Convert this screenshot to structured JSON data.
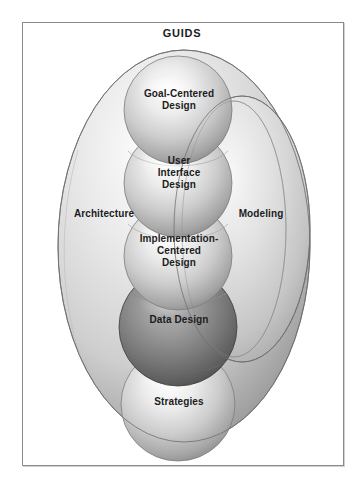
{
  "figure": {
    "title": "GUIDS",
    "background_color": "#ffffff",
    "frame_border_color": "#8b8b8b",
    "outline_color": "#6e6e6e",
    "text_color": "#1c1c1c"
  },
  "regions": [
    {
      "id": "architecture",
      "label": "Architecture",
      "shape": "ellipse",
      "fill_light": "#f2f2f2",
      "fill_dark": "#9a9a9a"
    },
    {
      "id": "modeling",
      "label": "Modeling",
      "shape": "ellipse",
      "fill_light": "#efefef",
      "fill_dark": "#a2a2a2"
    }
  ],
  "spheres": [
    {
      "id": "goal-centered-design",
      "label": "Goal-Centered\nDesign",
      "line1": "Goal-Centered",
      "line2": "Design",
      "line3": "",
      "fill_light": "#fbfbfb",
      "fill_dark": "#8d8d8d",
      "tone": "light"
    },
    {
      "id": "user-interface-design",
      "label": "User Interface Design",
      "line1": "User",
      "line2": "Interface",
      "line3": "Design",
      "fill_light": "#fbfbfb",
      "fill_dark": "#8d8d8d",
      "tone": "light"
    },
    {
      "id": "implementation-centered-design",
      "label": "Implementation-Centered Design",
      "line1": "Implementation-",
      "line2": "Centered",
      "line3": "Design",
      "fill_light": "#fbfbfb",
      "fill_dark": "#8d8d8d",
      "tone": "light"
    },
    {
      "id": "data-design",
      "label": "Data Design",
      "line1": "Data Design",
      "line2": "",
      "line3": "",
      "fill_light": "#a9a9a9",
      "fill_dark": "#4d4d4d",
      "tone": "dark"
    },
    {
      "id": "strategies",
      "label": "Strategies",
      "line1": "Strategies",
      "line2": "",
      "line3": "",
      "fill_light": "#fbfbfb",
      "fill_dark": "#8d8d8d",
      "tone": "light"
    }
  ]
}
